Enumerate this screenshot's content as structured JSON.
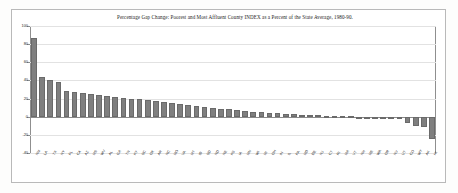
{
  "figure": {
    "title": "Percentage Gap Change: Poorest and Most Affluent County INDEX as a Percent of the State Average, 1980-90."
  },
  "chart_data": {
    "type": "bar",
    "title": "Percentage Gap Change: Poorest and Most Affluent County INDEX as a Percent of the State Average, 1980-90.",
    "xlabel": "",
    "ylabel": "",
    "ylim": [
      -40,
      100
    ],
    "yticks": [
      100,
      80,
      60,
      40,
      20,
      0,
      -20,
      -40
    ],
    "ytick_labels": [
      "100",
      "80",
      "60",
      "40",
      "20",
      "0",
      "-20",
      "-40"
    ],
    "grid": true,
    "legend": "none",
    "bar_color": "#7f7f7f",
    "categories": [
      "NM",
      "LA",
      "TX",
      "NY",
      "FL",
      "CA",
      "AZ",
      "MS",
      "WV",
      "AL",
      "GA",
      "TN",
      "KY",
      "SC",
      "OK",
      "AR",
      "NC",
      "MO",
      "VA",
      "MT",
      "ID",
      "SD",
      "ND",
      "NE",
      "KS",
      "IA",
      "MN",
      "WI",
      "MI",
      "OH",
      "IN",
      "IL",
      "PA",
      "MD",
      "DE",
      "NJ",
      "CT",
      "RI",
      "MA",
      "VT",
      "NH",
      "ME",
      "WA",
      "OR",
      "NV",
      "UT",
      "CO",
      "WY",
      "AK",
      "HI"
    ],
    "values": [
      87,
      44,
      40,
      38,
      28,
      27,
      26,
      25,
      24,
      23,
      22,
      21,
      20,
      19,
      18,
      17,
      16,
      15,
      14,
      13,
      12,
      11,
      10,
      9,
      8,
      7,
      6,
      5,
      5,
      4,
      4,
      3,
      3,
      2,
      2,
      2,
      1,
      1,
      1,
      1,
      0,
      0,
      0,
      -1,
      -1,
      -2,
      -7,
      -10,
      -11,
      -25
    ]
  }
}
